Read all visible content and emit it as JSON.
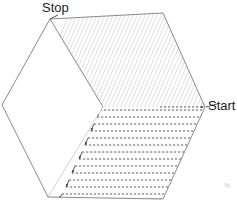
{
  "figure": {
    "type": "diagram",
    "canvas": {
      "width": 237,
      "height": 203,
      "background": "#ffffff"
    },
    "labels": {
      "stop": "Stop",
      "start": "Start",
      "corner_artifact": "%"
    },
    "colors": {
      "boundary": "#8a8a8a",
      "upper_hatch": "#d8d8d8",
      "lower_path": "#4a4a4a",
      "leader_line": "#555555",
      "label_text": "#1a1a1a",
      "background": "#ffffff"
    },
    "hexagon": {
      "vertices": [
        {
          "name": "top-left",
          "x": 50,
          "y": 19
        },
        {
          "name": "top-right",
          "x": 163,
          "y": 13
        },
        {
          "name": "right",
          "x": 205,
          "y": 107
        },
        {
          "name": "bottom-right",
          "x": 163,
          "y": 199
        },
        {
          "name": "bottom-left",
          "x": 48,
          "y": 197
        },
        {
          "name": "left",
          "x": 2,
          "y": 105
        }
      ]
    },
    "cells": [
      {
        "id": "upper-cell",
        "fill_style": "diagonal-hatch",
        "line_color": "#d8d8d8",
        "line_count": 46,
        "orientation": "diagonal",
        "polygon": [
          {
            "x": 50,
            "y": 19
          },
          {
            "x": 163,
            "y": 13
          },
          {
            "x": 205,
            "y": 107
          },
          {
            "x": 103,
            "y": 107
          }
        ]
      },
      {
        "id": "lower-cell",
        "fill_style": "horizontal-boustrophedon",
        "line_color": "#4a4a4a",
        "line_count": 14,
        "orientation": "horizontal",
        "polygon": [
          {
            "x": 103,
            "y": 107
          },
          {
            "x": 205,
            "y": 107
          },
          {
            "x": 163,
            "y": 199
          },
          {
            "x": 48,
            "y": 197
          }
        ]
      }
    ],
    "leaders": [
      {
        "id": "stop-leader",
        "from": {
          "x": 57,
          "y": 16
        },
        "to": {
          "x": 50,
          "y": 19
        },
        "style": "solid",
        "arrow": false
      },
      {
        "id": "start-leader",
        "from": {
          "x": 206,
          "y": 107
        },
        "to": {
          "x": 216,
          "y": 104
        },
        "style": "solid",
        "arrow": false
      }
    ]
  }
}
